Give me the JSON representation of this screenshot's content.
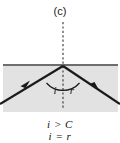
{
  "figure": {
    "panel_label": "(c)"
  },
  "diagram": {
    "normal_line": "dotted-normal-line",
    "interface_line": "medium-interface-boundary",
    "incident_ray": "incident-ray",
    "reflected_ray": "reflected-ray",
    "angle_arc": "angle-arc",
    "incidence_angle_label": "i",
    "reflection_angle_label": "r"
  },
  "conditions": {
    "line1": "i > C",
    "line2": "i = r"
  },
  "colors": {
    "medium_fill": "#e2e2e2",
    "ray_stroke": "#1a1a1a",
    "interface_stroke": "#6e6e6e",
    "normal_stroke": "#333333",
    "text": "#111111",
    "background": "#ffffff"
  }
}
